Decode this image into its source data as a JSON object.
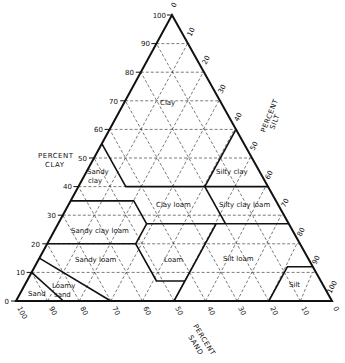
{
  "diagram": {
    "type": "ternary",
    "axes": {
      "clay": {
        "title_line1": "PERCENT",
        "title_line2": "CLAY",
        "ticks": [
          "0",
          "10",
          "20",
          "30",
          "40",
          "50",
          "60",
          "70",
          "80",
          "90",
          "100"
        ]
      },
      "silt": {
        "title_line1": "PERCENT",
        "title_line2": "SILT",
        "ticks": [
          "0",
          "10",
          "20",
          "30",
          "40",
          "50",
          "60",
          "70",
          "80",
          "90",
          "100"
        ]
      },
      "sand": {
        "title_line1": "PERCENT",
        "title_line2": "SAND",
        "ticks": [
          "100",
          "90",
          "80",
          "70",
          "60",
          "50",
          "40",
          "30",
          "20",
          "10",
          "0"
        ]
      }
    },
    "regions": [
      {
        "name": "Clay",
        "label": "Clay"
      },
      {
        "name": "Sandy clay",
        "label_line1": "Sandy",
        "label_line2": "clay"
      },
      {
        "name": "Silty clay",
        "label": "Silty clay"
      },
      {
        "name": "Clay loam",
        "label": "Clay loam"
      },
      {
        "name": "Silty clay loam",
        "label": "Silty clay loam"
      },
      {
        "name": "Sandy clay loam",
        "label": "Sandy clay loam"
      },
      {
        "name": "Loam",
        "label": "Loam"
      },
      {
        "name": "Silt loam",
        "label": "Silt loam"
      },
      {
        "name": "Sandy loam",
        "label": "Sandy loam"
      },
      {
        "name": "Silt",
        "label": "Silt"
      },
      {
        "name": "Loamy sand",
        "label_line1": "Loamy",
        "label_line2": "sand"
      },
      {
        "name": "Sand",
        "label": "Sand"
      }
    ],
    "line_color": "#111111",
    "grid_style": "dashed"
  }
}
